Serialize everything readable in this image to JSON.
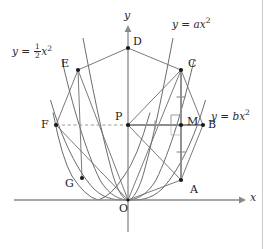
{
  "figure": {
    "kind": "geometry-diagram",
    "background_color": "#ffffff",
    "width": 274,
    "height": 249,
    "axes": {
      "x_label": "x",
      "y_label": "y",
      "origin_label": "O",
      "origin": {
        "x": 128,
        "y": 200
      },
      "x_axis": {
        "x1": 14,
        "y1": 200,
        "x2": 243,
        "y2": 200
      },
      "y_axis": {
        "x1": 128,
        "y1": 228,
        "x2": 128,
        "y2": 28
      }
    },
    "curves": [
      {
        "name": "parabola-half",
        "equation_label": "y = 1/2 x^2",
        "coefficient": 0.5,
        "color": "#5a5a5a"
      },
      {
        "name": "parabola-a",
        "equation_label": "y = a x^2",
        "coefficient": 1.55,
        "color": "#5a5a5a"
      },
      {
        "name": "parabola-b",
        "equation_label": "y = b x^2",
        "coefficient": 0.95,
        "color": "#5a5a5a"
      }
    ],
    "equation_labels": [
      {
        "id": "eq-half",
        "lhs": "y",
        "rel": "=",
        "coeff_num": "1",
        "coeff_den": "2",
        "var": "x",
        "exp": "2",
        "x": 12,
        "y": 44
      },
      {
        "id": "eq-a",
        "lhs": "y",
        "rel": "=",
        "coeff": "a",
        "var": "x",
        "exp": "2",
        "x": 172,
        "y": 18
      },
      {
        "id": "eq-b",
        "lhs": "y",
        "rel": "=",
        "coeff": "b",
        "var": "x",
        "exp": "2",
        "x": 212,
        "y": 110
      }
    ],
    "points": [
      {
        "name": "D",
        "label": "D",
        "x": 128,
        "y": 48,
        "lx": 133,
        "ly": 42
      },
      {
        "name": "E",
        "label": "E",
        "x": 78,
        "y": 70,
        "lx": 63,
        "ly": 60
      },
      {
        "name": "C",
        "label": "C",
        "x": 181,
        "y": 70,
        "lx": 187,
        "ly": 61
      },
      {
        "name": "F",
        "label": "F",
        "x": 56,
        "y": 125,
        "lx": 42,
        "ly": 120
      },
      {
        "name": "P",
        "label": "P",
        "x": 128,
        "y": 125,
        "lx": 117,
        "ly": 114
      },
      {
        "name": "M",
        "label": "M",
        "x": 181,
        "y": 125,
        "lx": 187,
        "ly": 117
      },
      {
        "name": "B",
        "label": "B",
        "x": 203,
        "y": 125,
        "lx": 208,
        "ly": 120
      },
      {
        "name": "G",
        "label": "G",
        "x": 82,
        "y": 178,
        "lx": 66,
        "ly": 178
      },
      {
        "name": "A",
        "label": "A",
        "x": 181,
        "y": 180,
        "lx": 189,
        "ly": 183
      },
      {
        "name": "O",
        "label": "O",
        "x": 128,
        "y": 200,
        "lx": 120,
        "ly": 204
      }
    ],
    "segments": [
      {
        "from": "E",
        "to": "D",
        "style": "solid"
      },
      {
        "from": "D",
        "to": "C",
        "style": "solid"
      },
      {
        "from": "E",
        "to": "G",
        "style": "solid"
      },
      {
        "from": "E",
        "to": "O",
        "style": "solid"
      },
      {
        "from": "F",
        "to": "O",
        "style": "solid"
      },
      {
        "from": "F",
        "to": "E",
        "style": "solid"
      },
      {
        "from": "F",
        "to": "P",
        "style": "dashed"
      },
      {
        "from": "P",
        "to": "C",
        "style": "solid"
      },
      {
        "from": "P",
        "to": "A",
        "style": "solid"
      },
      {
        "from": "P",
        "to": "B",
        "style": "bold"
      },
      {
        "from": "C",
        "to": "A",
        "style": "bold"
      },
      {
        "from": "C",
        "to": "B",
        "style": "solid"
      },
      {
        "from": "A",
        "to": "B",
        "style": "solid"
      },
      {
        "from": "C",
        "to": "O",
        "style": "solid"
      },
      {
        "from": "A",
        "to": "O",
        "style": "solid"
      }
    ],
    "tick_marks": [
      {
        "on": "segment-PM",
        "x": 155,
        "y": 125,
        "orientation": "vertical"
      },
      {
        "on": "segment-CM",
        "x": 181,
        "y": 97,
        "orientation": "horizontal"
      },
      {
        "on": "segment-MA",
        "x": 181,
        "y": 152,
        "orientation": "horizontal"
      }
    ],
    "right_angle_marker": {
      "at": "M",
      "x": 181,
      "y": 125,
      "size": 10
    }
  }
}
